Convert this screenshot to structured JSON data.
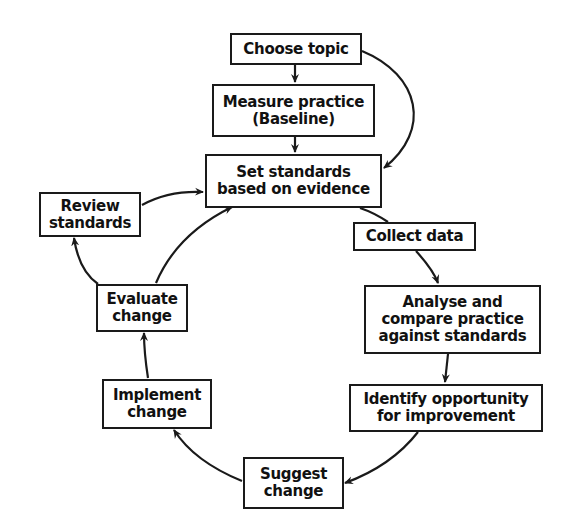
{
  "diagram": {
    "colors": {
      "line": "#1a1a1a",
      "text": "#111111",
      "background": "#ffffff"
    },
    "nodes": {
      "choose_topic": {
        "lines": [
          "Choose topic"
        ]
      },
      "measure_practice": {
        "lines": [
          "Measure practice",
          "(Baseline)"
        ]
      },
      "set_standards": {
        "lines": [
          "Set standards",
          "based on evidence"
        ]
      },
      "collect_data": {
        "lines": [
          "Collect data"
        ]
      },
      "analyse_compare": {
        "lines": [
          "Analyse and",
          "compare practice",
          "against standards"
        ]
      },
      "identify_opportunity": {
        "lines": [
          "Identify opportunity",
          "for improvement"
        ]
      },
      "suggest_change": {
        "lines": [
          "Suggest",
          "change"
        ]
      },
      "implement_change": {
        "lines": [
          "Implement",
          "change"
        ]
      },
      "evaluate_change": {
        "lines": [
          "Evaluate",
          "change"
        ]
      },
      "review_standards": {
        "lines": [
          "Review",
          "standards"
        ]
      }
    },
    "edges": [
      {
        "from": "Choose topic",
        "to": "Measure practice (Baseline)"
      },
      {
        "from": "Choose topic",
        "to": "Set standards based on evidence"
      },
      {
        "from": "Measure practice (Baseline)",
        "to": "Set standards based on evidence"
      },
      {
        "from": "Set standards based on evidence",
        "to": "Collect data"
      },
      {
        "from": "Collect data",
        "to": "Analyse and compare practice against standards"
      },
      {
        "from": "Analyse and compare practice against standards",
        "to": "Identify opportunity for improvement"
      },
      {
        "from": "Identify opportunity for improvement",
        "to": "Suggest change"
      },
      {
        "from": "Suggest change",
        "to": "Implement change"
      },
      {
        "from": "Implement change",
        "to": "Evaluate change"
      },
      {
        "from": "Evaluate change",
        "to": "Set standards based on evidence"
      },
      {
        "from": "Evaluate change",
        "to": "Review standards"
      },
      {
        "from": "Review standards",
        "to": "Set standards based on evidence"
      }
    ]
  }
}
